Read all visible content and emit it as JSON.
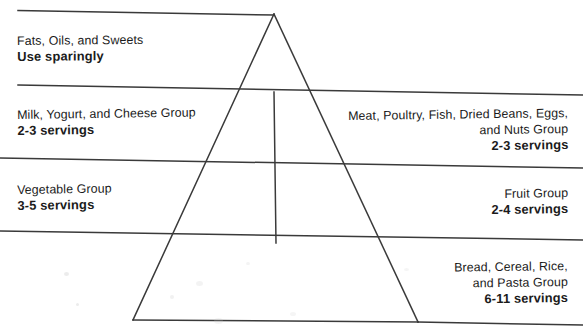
{
  "diagram": {
    "type": "food-guide-pyramid",
    "line_color": "#3a3a3a",
    "text_color": "#1b1b1b",
    "tiers": [
      {
        "id": "fats",
        "side": "left",
        "group_name": "Fats, Oils, and Sweets",
        "servings": "Use sparingly"
      },
      {
        "id": "milk",
        "side": "left",
        "group_name": "Milk, Yogurt, and Cheese Group",
        "servings": "2-3 servings"
      },
      {
        "id": "vegetable",
        "side": "left",
        "group_name": "Vegetable Group",
        "servings": "3-5 servings"
      },
      {
        "id": "meat",
        "side": "right",
        "group_name_line1": "Meat, Poultry, Fish, Dried Beans, Eggs,",
        "group_name_line2": "and Nuts Group",
        "servings": "2-3 servings"
      },
      {
        "id": "fruit",
        "side": "right",
        "group_name": "Fruit Group",
        "servings": "2-4 servings"
      },
      {
        "id": "bread",
        "side": "right",
        "group_name_line1": "Bread, Cereal, Rice,",
        "group_name_line2": "and Pasta Group",
        "servings": "6-11 servings"
      }
    ]
  }
}
